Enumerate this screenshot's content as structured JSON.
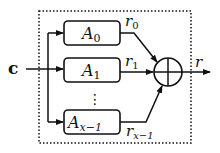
{
  "diagram": {
    "input_label": "c",
    "output_label": "r",
    "combiner": "oplus",
    "blocks": [
      {
        "name": "A",
        "sub": "0",
        "out_name": "r",
        "out_sub": "0"
      },
      {
        "name": "A",
        "sub": "1",
        "out_name": "r",
        "out_sub": "1"
      },
      {
        "name": "A",
        "sub": "x−1",
        "out_name": "r",
        "out_sub": "x−1"
      }
    ],
    "ellipsis": "⋮",
    "colors": {
      "stroke": "#111111",
      "background": "#ffffff"
    }
  }
}
